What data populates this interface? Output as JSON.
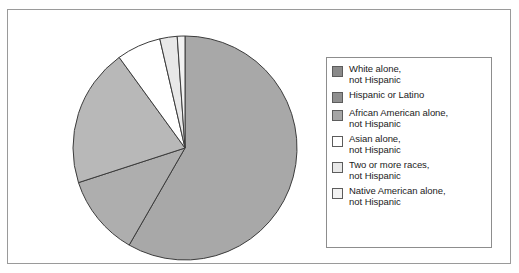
{
  "figure": {
    "background_color": "#ffffff",
    "frame_color": "#9a9a9a"
  },
  "legend": {
    "border_color": "#8d8d8d",
    "position": "right",
    "items": [
      {
        "label": "White alone,\nnot Hispanic",
        "color": "#8a8a8a"
      },
      {
        "label": "Hispanic or Latino",
        "color": "#8f8f8f"
      },
      {
        "label": "African American alone,\nnot Hispanic",
        "color": "#a6a6a6"
      },
      {
        "label": "Asian alone,\nnot Hispanic",
        "color": "#ffffff"
      },
      {
        "label": "Two or more races,\nnot Hispanic",
        "color": "#e8e8e8"
      },
      {
        "label": "Native American alone,\nnot Hispanic",
        "color": "#f2f2f2"
      }
    ]
  },
  "chart_data": {
    "type": "pie",
    "title": "",
    "subtitle": "",
    "xlabel": "",
    "ylabel": "",
    "legend_position": "right",
    "grid": false,
    "start_angle_deg": 0,
    "direction": "clockwise",
    "center": {
      "x": 114,
      "y": 114
    },
    "radius": 112,
    "stroke_color": "#3c3c3c",
    "categories": [
      "White alone, not Hispanic",
      "Hispanic or Latino",
      "African American alone, not Hispanic",
      "Asian alone, not Hispanic",
      "Two or more races, not Hispanic",
      "Native American alone, not Hispanic"
    ],
    "values": [
      58.3,
      11.7,
      20.0,
      6.4,
      2.5,
      1.1
    ],
    "slices": [
      {
        "label": "White alone, not Hispanic",
        "value": 58.3,
        "start_deg": 0.0,
        "end_deg": 209.9,
        "color": "#a8a8a8"
      },
      {
        "label": "Hispanic or Latino",
        "value": 11.7,
        "start_deg": 209.9,
        "end_deg": 252.0,
        "color": "#aeaeae"
      },
      {
        "label": "African American alone, not Hispanic",
        "value": 20.0,
        "start_deg": 252.0,
        "end_deg": 324.0,
        "color": "#b8b8b8"
      },
      {
        "label": "Asian alone, not Hispanic",
        "value": 6.4,
        "start_deg": 324.0,
        "end_deg": 347.0,
        "color": "#ffffff"
      },
      {
        "label": "Two or more races, not Hispanic",
        "value": 2.5,
        "start_deg": 347.0,
        "end_deg": 356.0,
        "color": "#e8e8e8"
      },
      {
        "label": "Native American alone, not Hispanic",
        "value": 1.1,
        "start_deg": 356.0,
        "end_deg": 360.0,
        "color": "#f2f2f2"
      }
    ]
  }
}
